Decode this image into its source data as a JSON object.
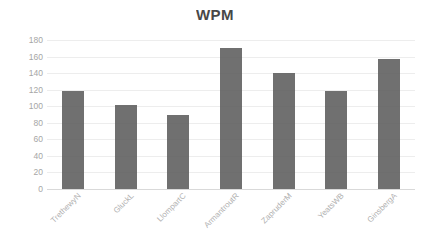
{
  "chart_data": {
    "type": "bar",
    "title": "WPM",
    "xlabel": "",
    "ylabel": "",
    "ylim": [
      0,
      180
    ],
    "ytick_step": 20,
    "yticks": [
      180,
      160,
      140,
      120,
      100,
      80,
      60,
      40,
      20,
      0
    ],
    "grid": true,
    "legend": null,
    "legend_position": "none",
    "bar_color": "#595959",
    "gridline_color": "#ededed",
    "tick_label_color": "#a6a6a6",
    "title_color": "#2e2e2e",
    "categories": [
      "TrethewyN",
      "GluckL",
      "LlompartC",
      "ArmantroutR",
      "ZapruderM",
      "YeatsWB",
      "GinsbergA"
    ],
    "values": [
      119,
      101,
      89,
      170,
      140,
      118,
      157
    ]
  }
}
